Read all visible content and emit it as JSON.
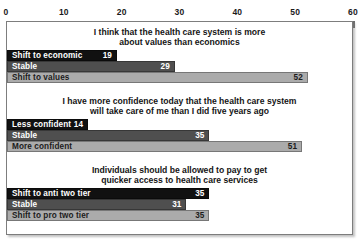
{
  "chart_data": {
    "type": "bar",
    "orientation": "horizontal",
    "title": "",
    "xlabel": "",
    "ylabel": "",
    "xlim": [
      0,
      60
    ],
    "xticks": [
      0,
      10,
      20,
      30,
      40,
      50,
      60
    ],
    "grid": false,
    "legend": "none",
    "series_colors": {
      "first": "#111111",
      "second": "#4f4f4f",
      "third": "#ababab"
    },
    "groups": [
      {
        "title": "I think that the health care system is more about values than economics",
        "title_lines": [
          "I think that the health care system is more",
          "about values than economics"
        ],
        "categories": [
          "Shift to economic",
          "Stable",
          "Shift to values"
        ],
        "values": [
          19,
          29,
          52
        ]
      },
      {
        "title": "I have more confidence today that the health care system will take care of me than I did five years ago",
        "title_lines": [
          "I have more confidence today that the health care system",
          "will take care of me than I did five years ago"
        ],
        "categories": [
          "Less confident",
          "Stable",
          "More confident"
        ],
        "values": [
          14,
          35,
          51
        ]
      },
      {
        "title": "Individuals should be allowed to pay to get quicker access to health care services",
        "title_lines": [
          "Individuals should be allowed to pay to get",
          "quicker access to health care services"
        ],
        "categories": [
          "Shift to anti two tier",
          "Stable",
          "Shift to pro two tier"
        ],
        "values": [
          35,
          31,
          35
        ]
      }
    ]
  }
}
